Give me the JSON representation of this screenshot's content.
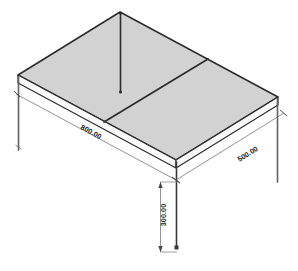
{
  "drawing": {
    "title": "Isometric slab and column frame",
    "background_color": "#ffffff",
    "slab_fill_color": "#d2d2d2",
    "slab_edge_color": "#2b2b2b",
    "slab_side_fill_color": "#f7f7f7",
    "column_color": "#3a3a3a",
    "dimension_line_color": "#555555",
    "dimension_text_color": "#1a1a1a"
  },
  "dimensions": {
    "length": {
      "label": "800.00",
      "name": "length-dimension",
      "orientation": "front-left-edge"
    },
    "width": {
      "label": "500.00",
      "name": "width-dimension",
      "orientation": "front-right-edge"
    },
    "height": {
      "label": "300.00",
      "name": "height-dimension",
      "orientation": "vertical-column"
    }
  },
  "elements": {
    "slab_panel_left": "slab-panel-left",
    "slab_panel_right": "slab-panel-right",
    "beam_center": "center-beam",
    "column_back": "back-column",
    "column_left": "left-column",
    "column_front": "front-column",
    "column_right": "right-column"
  }
}
